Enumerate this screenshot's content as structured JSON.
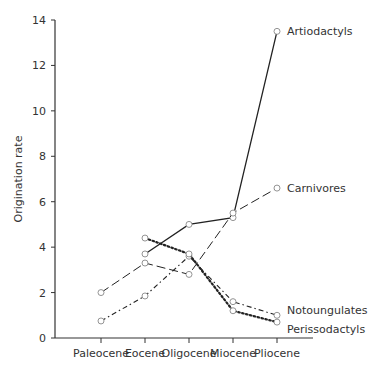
{
  "chart_data": {
    "type": "line",
    "title": "",
    "xlabel": "",
    "ylabel": "Origination rate",
    "categories": [
      "Paleocene",
      "Eocene",
      "Oligocene",
      "Miocene",
      "Pliocene"
    ],
    "ylim": [
      0,
      14
    ],
    "yticks": [
      0,
      2,
      4,
      6,
      8,
      10,
      12,
      14
    ],
    "grid": false,
    "legend": "direct labels at line ends",
    "series": [
      {
        "name": "Artiodactyls",
        "style": "solid",
        "values": [
          null,
          3.7,
          5.0,
          5.3,
          13.5
        ]
      },
      {
        "name": "Carnivores",
        "style": "long-dash",
        "values": [
          2.0,
          3.3,
          2.8,
          5.5,
          6.6
        ]
      },
      {
        "name": "Notoungulates",
        "style": "dash-dot",
        "values": [
          0.75,
          1.85,
          3.6,
          1.6,
          1.0
        ]
      },
      {
        "name": "Perissodactyls",
        "style": "dotted",
        "values": [
          null,
          4.4,
          3.7,
          1.2,
          0.7
        ]
      }
    ]
  }
}
